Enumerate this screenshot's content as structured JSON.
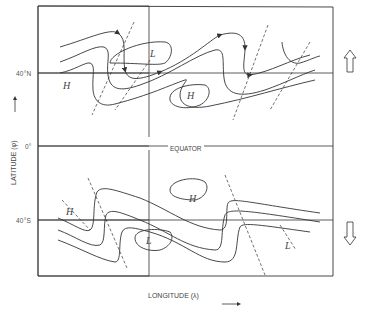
{
  "diagram": {
    "latitude_ticks": [
      {
        "label": "40°N"
      },
      {
        "label": "0°"
      },
      {
        "label": "40°S"
      }
    ],
    "equator_label": "EQUATOR",
    "y_axis_label": "LATITUDE (φ)",
    "x_axis_label": "LONGITUDE (λ)",
    "pressure_labels": {
      "north": [
        "H",
        "L",
        "H"
      ],
      "south": [
        "H",
        "H",
        "L",
        "L"
      ]
    },
    "transport_arrows": {
      "north": "upward (poleward) hollow arrow",
      "south": "downward (poleward) hollow arrow"
    },
    "colors": {
      "line": "#333333",
      "text": "#444444",
      "background": "#ffffff"
    }
  }
}
